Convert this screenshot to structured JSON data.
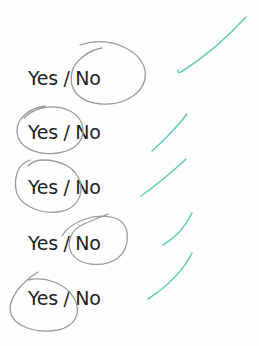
{
  "items": [
    {
      "text": "Yes / No",
      "answer": "No",
      "checked": true
    },
    {
      "text": "Yes / No",
      "answer": "Yes",
      "checked": true
    },
    {
      "text": "Yes / No",
      "answer": "Yes",
      "checked": true
    },
    {
      "text": "Yes / No",
      "answer": "No",
      "checked": true
    },
    {
      "text": "Yes / No",
      "answer": "Yes",
      "checked": true
    }
  ],
  "colors": {
    "ink": "#1e1e1e",
    "pencil": "#9a9a9a",
    "check": "#5fcfb4"
  }
}
